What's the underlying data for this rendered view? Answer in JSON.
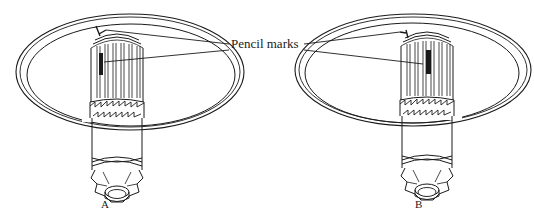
{
  "figure": {
    "callout_label": "Pencil marks",
    "panels": [
      {
        "id": "A",
        "label": "A"
      },
      {
        "id": "B",
        "label": "B"
      }
    ],
    "colors": {
      "ink": "#1a1a1a",
      "background": "#ffffff"
    }
  }
}
